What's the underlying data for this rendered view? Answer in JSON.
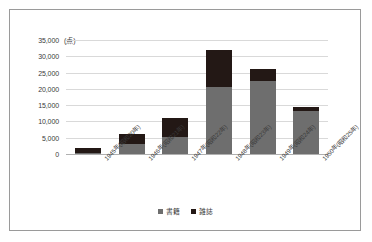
{
  "chart_data": {
    "type": "bar",
    "subtype": "stacked-bar",
    "title": "",
    "xlabel": "",
    "ylabel": "",
    "unit_label": "(点)",
    "ylim": [
      0,
      35000
    ],
    "ytick_step": 5000,
    "yticks": [
      "0",
      "5,000",
      "10,000",
      "15,000",
      "20,000",
      "25,000",
      "30,000",
      "35,000"
    ],
    "ytick_values": [
      0,
      5000,
      10000,
      15000,
      20000,
      25000,
      30000,
      35000
    ],
    "grid": true,
    "legend_position": "bottom",
    "categories": [
      "1945年(昭和20年)",
      "1946年(昭和21年)",
      "1947年(昭和22年)",
      "1948年(昭和23年)",
      "1949年(昭和24年)",
      "1950年(昭和25年)"
    ],
    "series": [
      {
        "name": "書籍",
        "color": "#6e6e6e",
        "values": [
          200,
          3000,
          5200,
          20500,
          22300,
          13200
        ]
      },
      {
        "name": "雑誌",
        "color": "#231815",
        "values": [
          1800,
          3000,
          5800,
          11500,
          3700,
          1100
        ]
      }
    ],
    "totals": [
      2000,
      6000,
      11000,
      32000,
      26000,
      14300
    ]
  },
  "legend": {
    "items": [
      {
        "label": "書籍",
        "color": "#6e6e6e"
      },
      {
        "label": "雑誌",
        "color": "#231815"
      }
    ]
  }
}
